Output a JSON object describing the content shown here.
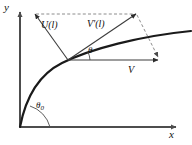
{
  "figure": {
    "type": "vector-diagram",
    "background_color": "#ffffff",
    "axes": {
      "x_label": "x",
      "y_label": "y",
      "origin": [
        20,
        127
      ],
      "x_axis_end": [
        178,
        127
      ],
      "y_axis_end": [
        20,
        10
      ],
      "axis_color": "#4d4d4d",
      "arrowheads": [
        "x",
        "y"
      ]
    },
    "curve": {
      "name": "trajectory",
      "color": "#1a1a1a",
      "description": "concave-down trajectory rising steeply from origin then flattening to the right",
      "start": [
        20,
        127
      ],
      "end": [
        190,
        30
      ]
    },
    "vectors": [
      {
        "id": "U",
        "label": "U(l)",
        "label_text": "U(l)",
        "from": [
          68,
          60
        ],
        "to": [
          35,
          14
        ],
        "color": "#3d3d3d",
        "style": "solid"
      },
      {
        "id": "Vprime",
        "label": "V'(l)",
        "label_text": "V'(l)",
        "from": [
          68,
          60
        ],
        "to": [
          137,
          14
        ],
        "color": "#3d3d3d",
        "style": "solid"
      },
      {
        "id": "V",
        "label": "V",
        "label_text": "V",
        "from": [
          68,
          60
        ],
        "to": [
          160,
          60
        ],
        "color": "#3d3d3d",
        "style": "solid"
      }
    ],
    "construction_lines": [
      {
        "id": "top-dashed",
        "from": [
          35,
          14
        ],
        "to": [
          137,
          14
        ],
        "style": "dashed",
        "color": "#808080"
      },
      {
        "id": "right-dashed",
        "from": [
          137,
          14
        ],
        "to": [
          160,
          60
        ],
        "style": "dashed",
        "color": "#808080"
      }
    ],
    "angles": [
      {
        "id": "theta",
        "label": "θ",
        "vertex": [
          68,
          60
        ],
        "between": [
          "V",
          "Vprime"
        ],
        "arc_radius": 22
      },
      {
        "id": "theta0",
        "label": "θ",
        "subscript": "0",
        "vertex": [
          20,
          127
        ],
        "between": [
          "x-axis",
          "curve-tangent-at-origin"
        ],
        "arc_radius": 30
      }
    ],
    "labels": {
      "y_axis": "y",
      "x_axis": "x",
      "vector_u": "U(l)",
      "vector_v_prime": "V'(l)",
      "vector_v": "V",
      "angle_theta": "θ",
      "angle_theta0_base": "θ",
      "angle_theta0_sub": "0"
    }
  }
}
